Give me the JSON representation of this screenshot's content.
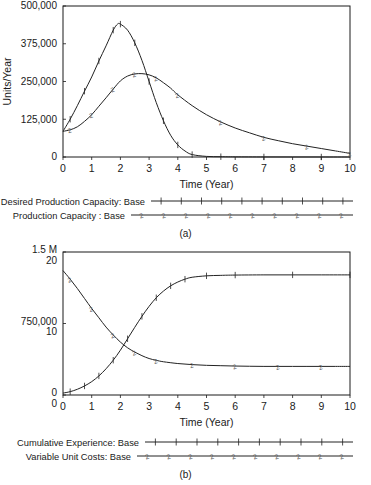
{
  "figure": {
    "panel_a_label": "(a)",
    "panel_b_label": "(b)"
  },
  "chart_data": [
    {
      "id": "chart-a",
      "type": "line",
      "title": "",
      "xlabel": "Time (Year)",
      "ylabel": "Units/Year",
      "xlim": [
        0,
        10
      ],
      "ylim": [
        0,
        500000
      ],
      "xticks": [
        0,
        1,
        2,
        3,
        4,
        5,
        6,
        7,
        8,
        9,
        10
      ],
      "xticklabels": [
        "0",
        "1",
        "2",
        "3",
        "4",
        "5",
        "6",
        "7",
        "8",
        "9",
        "10"
      ],
      "yticks": [
        0,
        125000,
        250000,
        375000,
        500000
      ],
      "yticklabels": [
        "0",
        "125,000",
        "250,000",
        "375,000",
        "500,000"
      ],
      "grid": false,
      "legend_position": "below",
      "series": [
        {
          "name": "Desired Production Capacity: Base",
          "marker": "1",
          "x": [
            0,
            0.25,
            0.5,
            0.75,
            1,
            1.25,
            1.5,
            1.75,
            1.9,
            2,
            2.25,
            2.5,
            2.75,
            3,
            3.25,
            3.5,
            3.75,
            4,
            4.25,
            4.5,
            5,
            5.5,
            6,
            7,
            8,
            9,
            10
          ],
          "values": [
            85000,
            125000,
            170000,
            218000,
            265000,
            318000,
            368000,
            420000,
            440000,
            440000,
            420000,
            378000,
            320000,
            250000,
            180000,
            120000,
            72000,
            40000,
            20000,
            8000,
            2000,
            1000,
            500,
            200,
            100,
            50,
            0
          ]
        },
        {
          "name": "Production Capacity : Base",
          "marker": "2",
          "x": [
            0,
            0.25,
            0.5,
            0.75,
            1,
            1.25,
            1.5,
            1.75,
            2,
            2.25,
            2.5,
            2.75,
            3,
            3.25,
            3.5,
            3.75,
            4,
            4.5,
            5,
            5.5,
            6,
            6.5,
            7,
            7.5,
            8,
            8.5,
            9,
            9.5,
            10
          ],
          "values": [
            85000,
            90000,
            100000,
            118000,
            140000,
            168000,
            196000,
            225000,
            252000,
            268000,
            275000,
            276000,
            272000,
            262000,
            246000,
            228000,
            206000,
            170000,
            140000,
            116000,
            96000,
            80000,
            65000,
            54000,
            44000,
            36000,
            28000,
            20000,
            12000
          ]
        }
      ]
    },
    {
      "id": "chart-b",
      "type": "line",
      "title": "",
      "xlabel": "Time (Year)",
      "ylabel": "",
      "xlim": [
        0,
        10
      ],
      "ylim_left": [
        0,
        1500000
      ],
      "ylim_right": [
        0,
        20
      ],
      "xticks": [
        0,
        1,
        2,
        3,
        4,
        5,
        6,
        7,
        8,
        9,
        10
      ],
      "xticklabels": [
        "0",
        "1",
        "2",
        "3",
        "4",
        "5",
        "6",
        "7",
        "8",
        "9",
        "10"
      ],
      "yticks_left": [
        0,
        750000,
        1500000
      ],
      "yticklabels_left": [
        "0",
        "750,000",
        "1.5 M"
      ],
      "yticks_right": [
        0,
        10,
        20
      ],
      "yticklabels_right": [
        "0",
        "10",
        "20"
      ],
      "grid": false,
      "legend_position": "below",
      "series": [
        {
          "name": "Cumulative Experience: Base",
          "marker": "1",
          "axis": "left",
          "x": [
            0,
            0.25,
            0.5,
            0.75,
            1,
            1.25,
            1.5,
            1.75,
            2,
            2.25,
            2.5,
            2.75,
            3,
            3.25,
            3.5,
            3.75,
            4,
            4.25,
            4.5,
            5,
            5.5,
            6,
            7,
            8,
            9,
            10
          ],
          "values": [
            20000,
            35000,
            60000,
            95000,
            140000,
            200000,
            275000,
            365000,
            470000,
            590000,
            710000,
            825000,
            930000,
            1020000,
            1090000,
            1145000,
            1185000,
            1215000,
            1235000,
            1250000,
            1255000,
            1258000,
            1260000,
            1260000,
            1260000,
            1260000
          ]
        },
        {
          "name": "Variable Unit Costs: Base",
          "marker": "2",
          "axis": "right",
          "x": [
            0,
            0.25,
            0.5,
            0.75,
            1,
            1.25,
            1.5,
            1.75,
            2,
            2.25,
            2.5,
            2.75,
            3,
            3.25,
            3.5,
            4,
            4.5,
            5,
            5.5,
            6,
            6.5,
            7,
            7.5,
            8,
            8.5,
            9,
            9.5,
            10
          ],
          "values": [
            17.4,
            16.2,
            14.9,
            13.5,
            12.1,
            10.8,
            9.5,
            8.4,
            7.4,
            6.6,
            6.0,
            5.5,
            5.1,
            4.85,
            4.65,
            4.4,
            4.25,
            4.15,
            4.1,
            4.05,
            4.02,
            4.0,
            4.0,
            4.0,
            4.0,
            4.0,
            4.0,
            4.0
          ]
        }
      ]
    }
  ],
  "legend_a": {
    "items": [
      {
        "label": "Desired Production Capacity: Base",
        "marker": "1"
      },
      {
        "label": "Production Capacity : Base",
        "marker": "2"
      }
    ]
  },
  "legend_b": {
    "items": [
      {
        "label": "Cumulative Experience: Base",
        "marker": "1"
      },
      {
        "label": "Variable Unit Costs: Base",
        "marker": "2"
      }
    ]
  },
  "colors": {
    "axis": "#1a1a1a",
    "curve": "#222222",
    "text": "#1a1a1a",
    "background": "#ffffff"
  }
}
